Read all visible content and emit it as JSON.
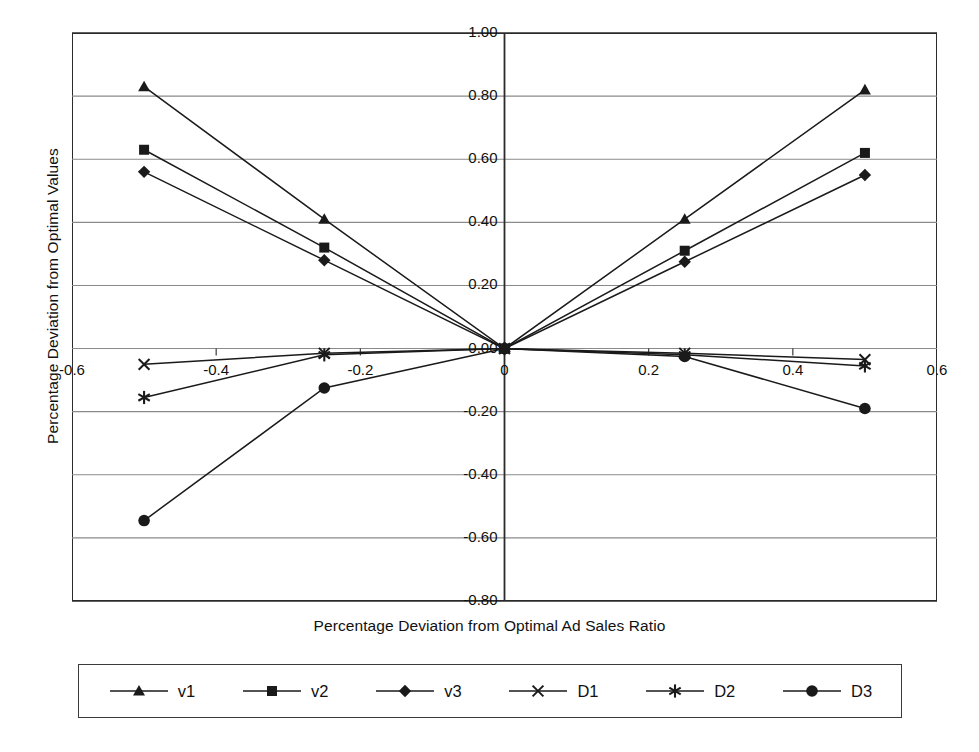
{
  "chart_data": {
    "type": "line",
    "title": "",
    "xlabel": "Percentage Deviation from Optimal Ad Sales Ratio",
    "ylabel": "Percentage Deviation from Optimal Values",
    "xlim": [
      -0.6,
      0.6
    ],
    "ylim": [
      -0.8,
      1.0
    ],
    "xticks": [
      -0.6,
      -0.4,
      -0.2,
      0,
      0.2,
      0.4,
      0.6
    ],
    "xticklabels": [
      "-0.6",
      "-0.4",
      "-0.2",
      "0",
      "0.2",
      "0.4",
      "0.6"
    ],
    "yticks": [
      1.0,
      0.8,
      0.6,
      0.4,
      0.2,
      0.0,
      -0.2,
      -0.4,
      -0.6,
      -0.8
    ],
    "yticklabels": [
      "1.00",
      "0.80",
      "0.60",
      "0.40",
      "0.20",
      "0.00",
      "-0.20",
      "-0.40",
      "-0.60",
      "-0.80"
    ],
    "grid": "horizontal",
    "legend_position": "bottom",
    "x": [
      -0.5,
      -0.25,
      0,
      0.25,
      0.5
    ],
    "series": [
      {
        "name": "v1",
        "marker": "triangle",
        "values": [
          0.83,
          0.41,
          0.0,
          0.41,
          0.82
        ]
      },
      {
        "name": "v2",
        "marker": "square",
        "values": [
          0.63,
          0.32,
          0.0,
          0.31,
          0.62
        ]
      },
      {
        "name": "v3",
        "marker": "diamond",
        "values": [
          0.56,
          0.28,
          0.0,
          0.275,
          0.55
        ]
      },
      {
        "name": "D1",
        "marker": "x",
        "values": [
          -0.05,
          -0.015,
          0.0,
          -0.015,
          -0.035
        ]
      },
      {
        "name": "D2",
        "marker": "asterisk",
        "values": [
          -0.155,
          -0.02,
          0.0,
          -0.02,
          -0.055
        ]
      },
      {
        "name": "D3",
        "marker": "circle",
        "values": [
          -0.545,
          -0.125,
          0.0,
          -0.025,
          -0.19
        ]
      }
    ]
  },
  "axis": {
    "y_title": "Percentage Deviation from Optimal Values",
    "x_title": "Percentage Deviation from Optimal Ad Sales Ratio",
    "y_labels": [
      "1.00",
      "0.80",
      "0.60",
      "0.40",
      "0.20",
      "0.00",
      "-0.20",
      "-0.40",
      "-0.60",
      "-0.80"
    ],
    "x_labels": [
      "-0.6",
      "-0.4",
      "-0.2",
      "0",
      "0.2",
      "0.4",
      "0.6"
    ]
  },
  "legend": {
    "items": [
      {
        "label": "v1",
        "marker": "triangle"
      },
      {
        "label": "v2",
        "marker": "square"
      },
      {
        "label": "v3",
        "marker": "diamond"
      },
      {
        "label": "D1",
        "marker": "x"
      },
      {
        "label": "D2",
        "marker": "asterisk"
      },
      {
        "label": "D3",
        "marker": "circle"
      }
    ]
  },
  "colors": {
    "line": "#1a1a1a",
    "grid": "#8a8a8a",
    "frame": "#2b2b2b",
    "text": "#111111",
    "background": "#ffffff"
  }
}
